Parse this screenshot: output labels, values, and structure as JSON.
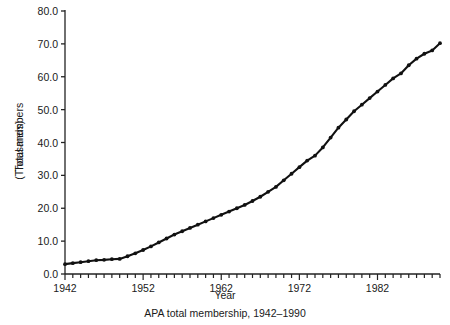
{
  "chart_data": {
    "type": "line",
    "title": "",
    "caption": "APA total membership, 1942–1990",
    "xlabel": "Year",
    "ylabel_line1": "Total members",
    "ylabel_line2": "(Thousands)",
    "xlim": [
      1942,
      1990
    ],
    "ylim": [
      0.0,
      80.0
    ],
    "grid": false,
    "legend": "none",
    "marker": "filled-circle",
    "line_color": "#111111",
    "marker_color": "#111111",
    "axis_color": "#222222",
    "background_color": "#ffffff",
    "y_ticks": [
      0.0,
      10.0,
      20.0,
      30.0,
      40.0,
      50.0,
      60.0,
      70.0,
      80.0
    ],
    "y_tick_labels": [
      "0.0",
      "10.0",
      "20.0",
      "30.0",
      "40.0",
      "50.0",
      "60.0",
      "70.0",
      "80.0"
    ],
    "x_ticks_minor_every": 1,
    "x_tick_labels": [
      "1942",
      "1952",
      "1962",
      "1972",
      "1982"
    ],
    "x_tick_label_values": [
      1942,
      1952,
      1962,
      1972,
      1982
    ],
    "x": [
      1942,
      1943,
      1944,
      1945,
      1946,
      1947,
      1948,
      1949,
      1950,
      1951,
      1952,
      1953,
      1954,
      1955,
      1956,
      1957,
      1958,
      1959,
      1960,
      1961,
      1962,
      1963,
      1964,
      1965,
      1966,
      1967,
      1968,
      1969,
      1970,
      1971,
      1972,
      1973,
      1974,
      1975,
      1976,
      1977,
      1978,
      1979,
      1980,
      1981,
      1982,
      1983,
      1984,
      1985,
      1986,
      1987,
      1988,
      1989,
      1990
    ],
    "values": [
      3.0,
      3.3,
      3.6,
      3.9,
      4.2,
      4.3,
      4.5,
      4.6,
      5.4,
      6.3,
      7.3,
      8.4,
      9.6,
      10.8,
      12.0,
      13.0,
      14.0,
      15.0,
      16.0,
      17.0,
      18.0,
      19.0,
      20.0,
      21.0,
      22.2,
      23.5,
      25.0,
      26.5,
      28.5,
      30.5,
      32.5,
      34.5,
      36.0,
      38.5,
      41.5,
      44.5,
      47.0,
      49.5,
      51.5,
      53.5,
      55.5,
      57.5,
      59.5,
      61.0,
      63.5,
      65.5,
      67.0,
      68.0,
      70.2
    ],
    "series": [
      {
        "name": "APA total membership",
        "values": [
          3.0,
          3.3,
          3.6,
          3.9,
          4.2,
          4.3,
          4.5,
          4.6,
          5.4,
          6.3,
          7.3,
          8.4,
          9.6,
          10.8,
          12.0,
          13.0,
          14.0,
          15.0,
          16.0,
          17.0,
          18.0,
          19.0,
          20.0,
          21.0,
          22.2,
          23.5,
          25.0,
          26.5,
          28.5,
          30.5,
          32.5,
          34.5,
          36.0,
          38.5,
          41.5,
          44.5,
          47.0,
          49.5,
          51.5,
          53.5,
          55.5,
          57.5,
          59.5,
          61.0,
          63.5,
          65.5,
          67.0,
          68.0,
          70.2
        ]
      }
    ]
  }
}
